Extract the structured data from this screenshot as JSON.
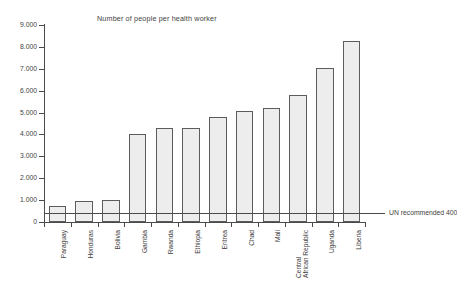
{
  "chart_data": {
    "type": "bar",
    "title": "Number of people per health worker",
    "xlabel": "",
    "ylabel": "",
    "ylim": [
      0,
      9000
    ],
    "ytick_values": [
      0,
      1000,
      2000,
      3000,
      4000,
      5000,
      6000,
      7000,
      8000,
      9000
    ],
    "ytick_labels": [
      "0",
      "1.000",
      "2.000",
      "3.000",
      "4.000",
      "5.000",
      "6.000",
      "7.000",
      "8.000",
      "9.000"
    ],
    "grid": false,
    "legend": null,
    "categories": [
      "Paraguay",
      "Honduras",
      "Bolivia",
      "Gambia",
      "Rwanda",
      "Ethiopia",
      "Eritrea",
      "Chad",
      "Mali",
      "Central African Republic",
      "Uganda",
      "Liberia"
    ],
    "category_label_lines": [
      [
        "Paraguay"
      ],
      [
        "Honduras"
      ],
      [
        "Bolivia"
      ],
      [
        "Gambia"
      ],
      [
        "Rwanda"
      ],
      [
        "Ethiopia"
      ],
      [
        "Eritrea"
      ],
      [
        "Chad"
      ],
      [
        "Mali"
      ],
      [
        "Central",
        "African Republic"
      ],
      [
        "Uganda"
      ],
      [
        "Liberia"
      ]
    ],
    "values": [
      730,
      950,
      1000,
      4000,
      4300,
      4300,
      4800,
      5050,
      5200,
      5800,
      7050,
      8250
    ],
    "annotations": [
      {
        "name": "un-recommended-line",
        "label": "UN recommended 400",
        "value": 400
      }
    ],
    "colors": {
      "bar_fill": "#ededed",
      "bar_border": "#5c5c5c",
      "axis": "#4a4a4a",
      "text": "#3f3f3f",
      "background": "#ffffff"
    }
  }
}
